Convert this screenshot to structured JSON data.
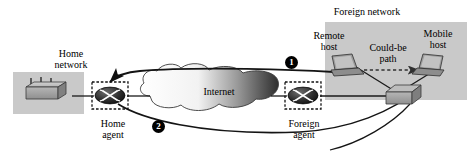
{
  "diagram": {
    "labels": {
      "foreign_network": "Foreign network",
      "home_network": "Home\nnetwork",
      "remote_host": "Remote\nhost",
      "mobile_host": "Mobile\nhost",
      "could_be_path": "Could-be\npath",
      "internet": "Internet",
      "home_agent": "Home\nagent",
      "foreign_agent": "Foreign\nagent"
    },
    "step_markers": [
      {
        "id": "step-1",
        "label": "1"
      },
      {
        "id": "step-2",
        "label": "2"
      }
    ],
    "nodes": [
      {
        "id": "home-hub",
        "icon": "hub-box-icon",
        "region": "home-network"
      },
      {
        "id": "home-agent",
        "icon": "router-icon",
        "region": "home-network"
      },
      {
        "id": "internet",
        "icon": "cloud-icon",
        "region": "backbone"
      },
      {
        "id": "foreign-agent",
        "icon": "router-icon",
        "region": "foreign-network"
      },
      {
        "id": "foreign-switch",
        "icon": "switch-box-icon",
        "region": "foreign-network"
      },
      {
        "id": "remote-host",
        "icon": "laptop-icon",
        "region": "foreign-network"
      },
      {
        "id": "mobile-host",
        "icon": "laptop-icon",
        "region": "foreign-network"
      }
    ],
    "edges": [
      {
        "id": "edge-hub-home-agent",
        "style": "solid"
      },
      {
        "id": "edge-home-agent-internet",
        "style": "solid"
      },
      {
        "id": "edge-internet-foreign-agent",
        "style": "solid"
      },
      {
        "id": "edge-foreign-agent-switch",
        "style": "solid"
      },
      {
        "id": "edge-switch-remote-host",
        "style": "solid"
      },
      {
        "id": "edge-switch-mobile-host",
        "style": "solid"
      },
      {
        "id": "edge-could-be-path",
        "style": "dashed-arrow"
      },
      {
        "id": "edge-step-1-to-home-agent",
        "style": "solid-arrow"
      },
      {
        "id": "edge-step-2-to-mobile-host",
        "style": "solid-arrow"
      }
    ],
    "colors": {
      "network_region_fill": "#c9c9c9",
      "device_fill": "#a8a8a8",
      "router_fill": "#2b2b2b",
      "line": "#1a1a1a",
      "marker_fill": "#000000",
      "marker_text": "#ffffff",
      "cloud_stroke": "#333333",
      "background": "#ffffff"
    }
  }
}
